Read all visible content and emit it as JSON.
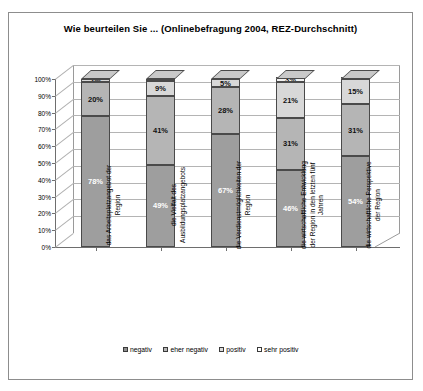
{
  "chart_data": {
    "type": "bar",
    "subtype": "stacked-percent-3d",
    "title": "Wie beurteilen Sie ... (Onlinebefragung 2004, REZ-Durchschnitt)",
    "xlabel": "",
    "ylabel": "",
    "ylim": [
      0,
      100
    ],
    "ytick_labels": [
      "0%",
      "10%",
      "20%",
      "30%",
      "40%",
      "50%",
      "60%",
      "70%",
      "80%",
      "90%",
      "100%"
    ],
    "ytick_values": [
      0,
      10,
      20,
      30,
      40,
      50,
      60,
      70,
      80,
      90,
      100
    ],
    "grid": true,
    "legend_position": "bottom",
    "categories": [
      "das Arbeitsplatzangebot der Region",
      "die Vielfalt des Ausbildungsplatzangebots",
      "die Verdienstmöglichkeiten der Region",
      "die wirtschaftliche Entwicklung der Region in den letzten fünf Jahren",
      "die wirtschaftliche Perspektive der Region"
    ],
    "series": [
      {
        "name": "negativ",
        "values": [
          78,
          49,
          67,
          46,
          54
        ]
      },
      {
        "name": "eher negativ",
        "values": [
          20,
          41,
          28,
          31,
          31
        ]
      },
      {
        "name": "positiv",
        "values": [
          2,
          9,
          5,
          21,
          15
        ]
      },
      {
        "name": "sehr positiv",
        "values": [
          0,
          1,
          0,
          3,
          1
        ]
      }
    ],
    "data_labels": [
      [
        "78%",
        "20%",
        "2%",
        ""
      ],
      [
        "49%",
        "41%",
        "9%",
        "1%"
      ],
      [
        "67%",
        "28%",
        "5%",
        ""
      ],
      [
        "46%",
        "31%",
        "21%",
        "3%"
      ],
      [
        "54%",
        "31%",
        "15%",
        "1%"
      ]
    ]
  },
  "legend": {
    "items": [
      {
        "label": "negativ"
      },
      {
        "label": "eher negativ"
      },
      {
        "label": "positiv"
      },
      {
        "label": "sehr positiv"
      }
    ]
  },
  "colors": {
    "negativ": "#9e9e9e",
    "eher_negativ": "#b5b5b5",
    "positiv": "#d8d8d8",
    "sehr_positiv": "#f2f2f2",
    "bar_side": "#6d6d6d",
    "bar_top": "#c9c9c9",
    "grid": "#b4b4b4",
    "axis": "#6e6e6e",
    "frame": "#8d8d8d"
  }
}
